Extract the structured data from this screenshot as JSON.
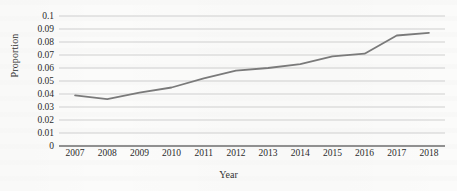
{
  "chart_data": {
    "type": "line",
    "title": "",
    "xlabel": "Year",
    "ylabel": "Proportion",
    "categories": [
      "2007",
      "2008",
      "2009",
      "2010",
      "2011",
      "2012",
      "2013",
      "2014",
      "2015",
      "2016",
      "2017",
      "2018"
    ],
    "values": [
      0.039,
      0.036,
      0.041,
      0.045,
      0.052,
      0.058,
      0.06,
      0.063,
      0.069,
      0.071,
      0.085,
      0.087
    ],
    "series": [
      {
        "name": "Proportion",
        "values": [
          0.039,
          0.036,
          0.041,
          0.045,
          0.052,
          0.058,
          0.06,
          0.063,
          0.069,
          0.071,
          0.085,
          0.087
        ]
      }
    ],
    "ylim": [
      0,
      0.1
    ],
    "ytick_labels": [
      "0",
      "0.01",
      "0.02",
      "0.03",
      "0.04",
      "0.05",
      "0.06",
      "0.07",
      "0.08",
      "0.09",
      "0.1"
    ],
    "ytick_values": [
      0,
      0.01,
      0.02,
      0.03,
      0.04,
      0.05,
      0.06,
      0.07,
      0.08,
      0.09,
      0.1
    ],
    "grid": true,
    "grid_axis": "y",
    "legend": false,
    "legend_position": "none",
    "line_color": "#7a7a7a",
    "grid_color": "#c9c9c9",
    "axis_color": "#6e6e6e",
    "background_color": "#fbfbfa",
    "annotations": []
  }
}
